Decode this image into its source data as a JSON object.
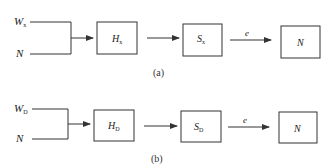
{
  "diagrams": [
    {
      "caption": "(a)",
      "inputs": [
        {
          "main": "W",
          "sub": "x"
        },
        {
          "main": "N",
          "sub": ""
        }
      ],
      "blocks": [
        {
          "main": "H",
          "sub": "x"
        },
        {
          "main": "S",
          "sub": "x"
        },
        {
          "main": "N",
          "sub": ""
        }
      ],
      "edge_label": "e"
    },
    {
      "caption": "(b)",
      "inputs": [
        {
          "main": "W",
          "sub": "D"
        },
        {
          "main": "N",
          "sub": ""
        }
      ],
      "blocks": [
        {
          "main": "H",
          "sub": "D"
        },
        {
          "main": "S",
          "sub": "D"
        },
        {
          "main": "N",
          "sub": ""
        }
      ],
      "edge_label": "e"
    }
  ]
}
